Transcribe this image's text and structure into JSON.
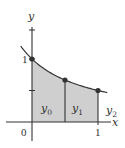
{
  "figure": {
    "function": "y = 1/(1+x)",
    "x_domain": [
      -0.17,
      1.14
    ],
    "sample_points": [
      {
        "x": 0,
        "y": 1,
        "label": "y",
        "subscript": "0"
      },
      {
        "x": 0.5,
        "y": 0.6667,
        "label": "y",
        "subscript": "1"
      },
      {
        "x": 1,
        "y": 0.5,
        "label": "y",
        "subscript": "2"
      }
    ],
    "axes": {
      "x_label": "x",
      "y_label": "y",
      "x_ticks": [
        {
          "value": 0,
          "label": "0"
        },
        {
          "value": 1,
          "label": "1"
        }
      ],
      "y_ticks": [
        {
          "value": 1,
          "label": "1"
        },
        {
          "value": 0.5,
          "label": ""
        }
      ]
    },
    "shaded_region": {
      "from": 0,
      "to": 1
    },
    "colors": {
      "shade": "#cfcfcf",
      "ink": "#333333",
      "background": "#ffffff"
    }
  }
}
